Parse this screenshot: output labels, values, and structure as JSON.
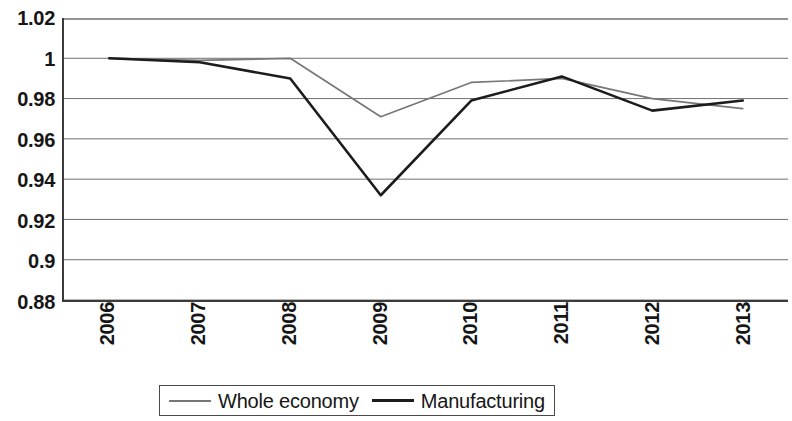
{
  "chart_data": {
    "type": "line",
    "title": "",
    "subtitle": "",
    "xlabel": "",
    "ylabel": "",
    "x": [
      "2006",
      "2007",
      "2008",
      "2009",
      "2010",
      "2011",
      "2012",
      "2013"
    ],
    "categories": [
      "2006",
      "2007",
      "2008",
      "2009",
      "2010",
      "2011",
      "2012",
      "2013"
    ],
    "series": [
      {
        "name": "Whole economy",
        "color": "#777777",
        "values": [
          1.0,
          0.999,
          1.0,
          0.971,
          0.988,
          0.99,
          0.98,
          0.975
        ]
      },
      {
        "name": "Manufacturing",
        "color": "#1c1c1c",
        "values": [
          1.0,
          0.998,
          0.99,
          0.932,
          0.979,
          0.991,
          0.974,
          0.979
        ]
      }
    ],
    "ylim": [
      0.88,
      1.02
    ],
    "yticks": [
      1.02,
      1.0,
      0.98,
      0.96,
      0.94,
      0.92,
      0.9,
      0.88
    ],
    "ytick_labels": [
      "1.02",
      "1",
      "0.98",
      "0.96",
      "0.94",
      "0.92",
      "0.9",
      "0.88"
    ],
    "grid": true,
    "grid_axis": "y",
    "legend_position": "bottom",
    "legend_border": true
  },
  "legend": {
    "items": [
      {
        "label": "Whole economy",
        "swatch": "line-swatch-light"
      },
      {
        "label": "Manufacturing",
        "swatch": "line-swatch-dark"
      }
    ]
  },
  "colors": {
    "whole_economy": "#777777",
    "manufacturing": "#1c1c1c",
    "axis": "#3b3b3b",
    "gridline": "#6f6f6f",
    "background": "#ffffff",
    "text": "#161616"
  }
}
